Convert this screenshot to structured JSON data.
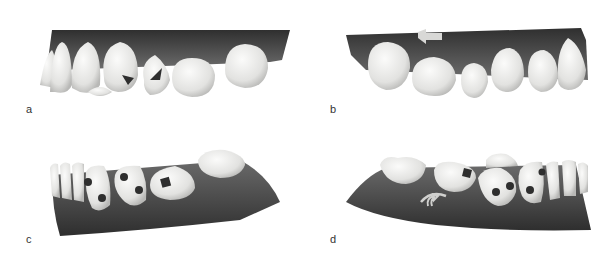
{
  "figure": {
    "panels": [
      {
        "id": "a",
        "label": "a",
        "view": "upper arch, right lateral view",
        "annotations": [
          "two dark occlusal/buccal markers"
        ]
      },
      {
        "id": "b",
        "label": "b",
        "view": "upper arch, left lateral view",
        "annotations": [
          "left-pointing arrow on gingiva"
        ]
      },
      {
        "id": "c",
        "label": "c",
        "view": "lower arch, right lateral view",
        "annotations": [
          "dark markers on teeth"
        ]
      },
      {
        "id": "d",
        "label": "d",
        "view": "lower arch, left lateral view",
        "annotations": [
          "curved rotation arrow on gingiva",
          "dark markers on teeth"
        ]
      }
    ],
    "colors": {
      "gingiva_dark": "#3a3a3a",
      "gingiva_light": "#7a7a7a",
      "tooth": "#e8e8e6",
      "tooth_shadow": "#bdbdbb",
      "marker": "#2e2e2e",
      "background": "#ffffff"
    }
  }
}
